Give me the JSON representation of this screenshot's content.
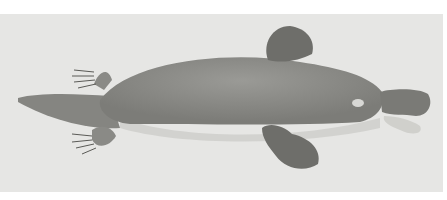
{
  "image": {
    "subject": "platypus illustration",
    "style": "grayscale engraving on off-white plate",
    "colors": {
      "background": "#e6e6e4",
      "border": "#ffffff",
      "body": "#8a8a86",
      "belly": "#d2d2cf",
      "bill": "#7a7a76",
      "feet": "#6e6e6a"
    }
  }
}
